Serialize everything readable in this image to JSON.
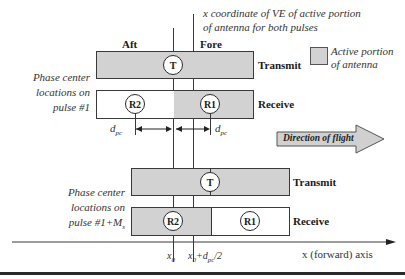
{
  "header": {
    "caption_line1": "x coordinate of VE of active portion",
    "caption_line2": "of antenna for  both pulses"
  },
  "labels": {
    "aft": "Aft",
    "fore": "Fore"
  },
  "legend": {
    "line1": "Active portion",
    "line2": "of antenna",
    "swatch_color": "#d2d2d2"
  },
  "pulse1": {
    "side_label": [
      "Phase center",
      "locations on",
      "pulse #1"
    ],
    "transmit_label": "Transmit",
    "receive_label": "Receive",
    "t_marker": "T",
    "r2_marker": "R2",
    "r1_marker": "R1",
    "dpc_left": "d",
    "dpc_left_sub": "pc",
    "dpc_right": "d",
    "dpc_right_sub": "pc"
  },
  "direction": {
    "label": "Direction of flight"
  },
  "pulse2": {
    "side_label": [
      "Phase center",
      "locations on",
      "pulse #1+M"
    ],
    "side_label_sub": "s",
    "transmit_label": "Transmit",
    "receive_label": "Receive",
    "t_marker": "T",
    "r2_marker": "R2",
    "r1_marker": "R1"
  },
  "axis": {
    "tick1": "x",
    "tick1_sub": "0",
    "tick2_pre": "x",
    "tick2_sub": "0",
    "tick2_mid": "+d",
    "tick2_sub2": "pc",
    "tick2_post": "/2",
    "axis_label": "x (forward) axis"
  },
  "colors": {
    "active_fill": "#d2d2d2",
    "line": "#3a3a3a",
    "arrow_fill": "#d0d0d0"
  }
}
